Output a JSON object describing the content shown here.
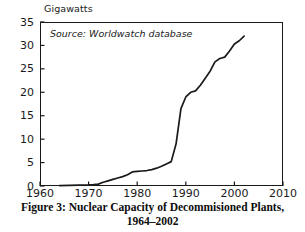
{
  "figure": {
    "caption_line1": "Figure 3: Nuclear Capacity of Decommisioned Plants,",
    "caption_line2": "1964–2002",
    "source_note": "Source: Worldwatch database",
    "axis_title_y": "Gigawatts"
  },
  "chart_data": {
    "type": "line",
    "title": "Figure 3: Nuclear Capacity of Decommisioned Plants, 1964–2002",
    "subtitle": "Source: Worldwatch database",
    "xlabel": "",
    "ylabel": "Gigawatts",
    "xlim": [
      1960,
      2010
    ],
    "ylim": [
      0,
      35
    ],
    "xticks": [
      1960,
      1970,
      1980,
      1990,
      2000,
      2010
    ],
    "yticks": [
      0,
      5,
      10,
      15,
      20,
      25,
      30,
      35
    ],
    "xtick_labels": [
      "1960",
      "1970",
      "1980",
      "1990",
      "2000",
      "2010"
    ],
    "ytick_labels": [
      "0",
      "5",
      "10",
      "15",
      "20",
      "25",
      "30",
      "35"
    ],
    "grid": false,
    "legend": false,
    "line_color": "#1a1a1a",
    "series": [
      {
        "name": "Decommissioned nuclear capacity",
        "x": [
          1964,
          1966,
          1968,
          1970,
          1971,
          1972,
          1973,
          1974,
          1975,
          1976,
          1977,
          1978,
          1979,
          1980,
          1981,
          1982,
          1983,
          1984,
          1985,
          1986,
          1987,
          1988,
          1989,
          1990,
          1991,
          1992,
          1993,
          1994,
          1995,
          1996,
          1997,
          1998,
          1999,
          2000,
          2001,
          2002
        ],
        "y": [
          0.1,
          0.15,
          0.2,
          0.25,
          0.3,
          0.4,
          0.8,
          1.1,
          1.4,
          1.7,
          2.0,
          2.4,
          3.0,
          3.1,
          3.2,
          3.3,
          3.5,
          3.8,
          4.2,
          4.7,
          5.2,
          9.0,
          16.5,
          19.0,
          20.0,
          20.3,
          21.5,
          23.0,
          24.5,
          26.5,
          27.2,
          27.5,
          28.8,
          30.3,
          31.0,
          32.0
        ]
      }
    ]
  },
  "yticks": [
    {
      "label": "35",
      "value": 35
    },
    {
      "label": "30",
      "value": 30
    },
    {
      "label": "25",
      "value": 25
    },
    {
      "label": "20",
      "value": 20
    },
    {
      "label": "15",
      "value": 15
    },
    {
      "label": "10",
      "value": 10
    },
    {
      "label": "5",
      "value": 5
    },
    {
      "label": "0",
      "value": 0
    }
  ],
  "xticks": [
    {
      "label": "1960",
      "value": 1960
    },
    {
      "label": "1970",
      "value": 1970
    },
    {
      "label": "1980",
      "value": 1980
    },
    {
      "label": "1990",
      "value": 1990
    },
    {
      "label": "2000",
      "value": 2000
    },
    {
      "label": "2010",
      "value": 2010
    }
  ]
}
